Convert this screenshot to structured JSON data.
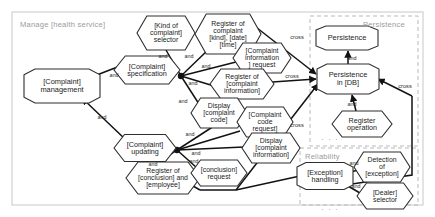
{
  "diagram": {
    "title": "Manage [health service]",
    "type": "feature-goal-model",
    "outer_container": {
      "label": "Manage [health service]",
      "border": "#c8c8c8"
    },
    "panels": [
      {
        "id": "persistence",
        "label": "Persistence",
        "border_style": "dashed",
        "border": "#b9b9b9"
      },
      {
        "id": "reliability",
        "label": "Reliability",
        "border_style": "dashed",
        "border": "#b9b9b9"
      }
    ],
    "shapes": {
      "octagon": "capability",
      "hexagon": "operation"
    },
    "colors": {
      "node_stroke": "#2e2e2e",
      "node_fill": "#ffffff",
      "edge": "#121212",
      "panel_text": "#9b9b9b"
    },
    "nodes": [
      {
        "id": "complaint-management",
        "label": "[Complaint]\nmanagement",
        "shape": "octagon",
        "x": 62,
        "y": 86,
        "w": 76,
        "h": 34,
        "fs": 7.4
      },
      {
        "id": "complaint-specification",
        "label": "[Complaint]\nspecification",
        "shape": "hexagon",
        "x": 147,
        "y": 70,
        "w": 66,
        "h": 28,
        "fs": 7.2
      },
      {
        "id": "kind-of-complaint-selector",
        "label": "[Kind of\ncomplaint]\nselector",
        "shape": "hexagon",
        "x": 166,
        "y": 33,
        "w": 58,
        "h": 34,
        "fs": 7.0
      },
      {
        "id": "register-of-complaint",
        "label": "Register of\ncomplaint\n[kind], [date]\n[time]",
        "shape": "hexagon",
        "x": 228,
        "y": 34,
        "w": 66,
        "h": 40,
        "fs": 6.9
      },
      {
        "id": "complaint-information-request",
        "label": "[Complaint\ninformation\n] request",
        "shape": "hexagon",
        "x": 262,
        "y": 58,
        "w": 58,
        "h": 30,
        "fs": 6.9
      },
      {
        "id": "register-of-complaint-information",
        "label": "Register of\n[complaint\ninformation]",
        "shape": "hexagon",
        "x": 242,
        "y": 84,
        "w": 64,
        "h": 30,
        "fs": 6.9
      },
      {
        "id": "display-complaint-code",
        "label": "Display\n[complaint\ncode]",
        "shape": "hexagon",
        "x": 219,
        "y": 113,
        "w": 56,
        "h": 30,
        "fs": 6.9
      },
      {
        "id": "complaint-code-request",
        "label": "[Complaint\ncode\nrequest]",
        "shape": "hexagon",
        "x": 265,
        "y": 122,
        "w": 56,
        "h": 30,
        "fs": 6.9
      },
      {
        "id": "display-complaint-information",
        "label": "Display\n[complaint\ninformation]",
        "shape": "hexagon",
        "x": 271,
        "y": 148,
        "w": 58,
        "h": 30,
        "fs": 6.9
      },
      {
        "id": "complaint-updating",
        "label": "[Complaint]\nupdating",
        "shape": "hexagon",
        "x": 145,
        "y": 148,
        "w": 62,
        "h": 27,
        "fs": 7.2
      },
      {
        "id": "register-of-conclusion",
        "label": "Register of\n[conclusion] and\n[employee]",
        "shape": "hexagon",
        "x": 163,
        "y": 178,
        "w": 74,
        "h": 32,
        "fs": 6.9
      },
      {
        "id": "conclusion-request",
        "label": "[conclusion]\nrequest",
        "shape": "hexagon",
        "x": 219,
        "y": 173,
        "w": 56,
        "h": 26,
        "fs": 6.9
      },
      {
        "id": "persistence",
        "label": "Persistence",
        "shape": "octagon",
        "x": 347,
        "y": 38,
        "w": 62,
        "h": 24,
        "fs": 7.4
      },
      {
        "id": "persistence-in-db",
        "label": "Persistence\nin [DB]",
        "shape": "octagon",
        "x": 348,
        "y": 79,
        "w": 62,
        "h": 30,
        "fs": 7.4
      },
      {
        "id": "register-operation",
        "label": "Register\noperation",
        "shape": "hexagon",
        "x": 362,
        "y": 124,
        "w": 60,
        "h": 26,
        "fs": 7.2
      },
      {
        "id": "exception-handling",
        "label": "[Exception]\nhandling",
        "shape": "octagon",
        "x": 325,
        "y": 176,
        "w": 56,
        "h": 27,
        "fs": 7.2
      },
      {
        "id": "detection-of-exception",
        "label": "Detection\nof\n[exception]",
        "shape": "hexagon",
        "x": 382,
        "y": 167,
        "w": 56,
        "h": 30,
        "fs": 6.9
      },
      {
        "id": "dealer-selector",
        "label": "[Dealer]\nselector",
        "shape": "hexagon",
        "x": 385,
        "y": 196,
        "w": 56,
        "h": 26,
        "fs": 6.9
      }
    ],
    "edge_labels": [
      {
        "id": "e1",
        "text": "and",
        "x": 114,
        "y": 75
      },
      {
        "id": "e2",
        "text": "and",
        "x": 163,
        "y": 56
      },
      {
        "id": "e3",
        "text": "and",
        "x": 189,
        "y": 56
      },
      {
        "id": "e4",
        "text": "and",
        "x": 206,
        "y": 66
      },
      {
        "id": "e5",
        "text": "and",
        "x": 193,
        "y": 83
      },
      {
        "id": "e6",
        "text": "and",
        "x": 183,
        "y": 101
      },
      {
        "id": "e7",
        "text": "and",
        "x": 102,
        "y": 117
      },
      {
        "id": "e8",
        "text": "and",
        "x": 190,
        "y": 134
      },
      {
        "id": "e9",
        "text": "and",
        "x": 196,
        "y": 153
      },
      {
        "id": "e10",
        "text": "and",
        "x": 194,
        "y": 161
      },
      {
        "id": "e11",
        "text": "and",
        "x": 153,
        "y": 164
      },
      {
        "id": "e12",
        "text": "and",
        "x": 352,
        "y": 58
      },
      {
        "id": "e13",
        "text": "and",
        "x": 352,
        "y": 104
      },
      {
        "id": "e14",
        "text": "and",
        "x": 354,
        "y": 163
      },
      {
        "id": "e15",
        "text": "and",
        "x": 356,
        "y": 186
      },
      {
        "id": "c1",
        "text": "cross",
        "x": 297,
        "y": 37
      },
      {
        "id": "c2",
        "text": "cross",
        "x": 292,
        "y": 76
      },
      {
        "id": "c3",
        "text": "cross",
        "x": 297,
        "y": 125
      },
      {
        "id": "c4",
        "text": "cross",
        "x": 405,
        "y": 86
      }
    ],
    "ellipses": [
      {
        "id": "p1",
        "text": "· · ·",
        "x": 330,
        "y": 139
      },
      {
        "id": "p2",
        "text": "· · ·",
        "x": 330,
        "y": 209
      }
    ]
  }
}
